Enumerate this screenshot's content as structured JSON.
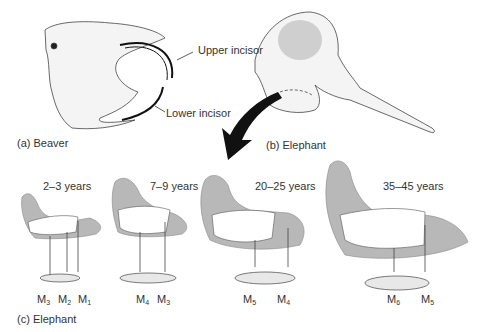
{
  "figure": {
    "panels": [
      {
        "id": "a",
        "caption": "(a) Beaver",
        "labels": [
          "Upper incisor",
          "Lower incisor"
        ]
      },
      {
        "id": "b",
        "caption": "(b) Elephant"
      },
      {
        "id": "c",
        "caption": "(c) Elephant",
        "stages": [
          {
            "age": "2–3 years",
            "molars": [
              {
                "m": "M",
                "n": "3"
              },
              {
                "m": "M",
                "n": "2"
              },
              {
                "m": "M",
                "n": "1"
              }
            ]
          },
          {
            "age": "7–9 years",
            "molars": [
              {
                "m": "M",
                "n": "4"
              },
              {
                "m": "M",
                "n": "3"
              }
            ]
          },
          {
            "age": "20–25 years",
            "molars": [
              {
                "m": "M",
                "n": "5"
              },
              {
                "m": "M",
                "n": "4"
              }
            ]
          },
          {
            "age": "35–45 years",
            "molars": [
              {
                "m": "M",
                "n": "6"
              },
              {
                "m": "M",
                "n": "5"
              }
            ]
          }
        ]
      }
    ],
    "colors": {
      "jaw_fill": "#b8b8b8",
      "line": "#333333",
      "arrow": "#111111"
    }
  }
}
